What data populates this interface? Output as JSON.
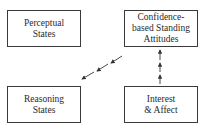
{
  "diagram": {
    "nodes": [
      {
        "id": "perceptual",
        "lines": [
          "Perceptual",
          "States"
        ]
      },
      {
        "id": "confidence",
        "lines": [
          "Confidence-",
          "based Standing",
          "Attitudes"
        ]
      },
      {
        "id": "reasoning",
        "lines": [
          "Reasoning",
          "States"
        ]
      },
      {
        "id": "interest",
        "lines": [
          "Interest",
          "& Affect"
        ]
      }
    ],
    "edges": [
      {
        "from": "interest",
        "to": "confidence",
        "style": "dashed-arrows",
        "count": 3
      },
      {
        "from": "confidence",
        "to": "reasoning",
        "style": "dashed-arrows",
        "count": 3
      }
    ]
  }
}
